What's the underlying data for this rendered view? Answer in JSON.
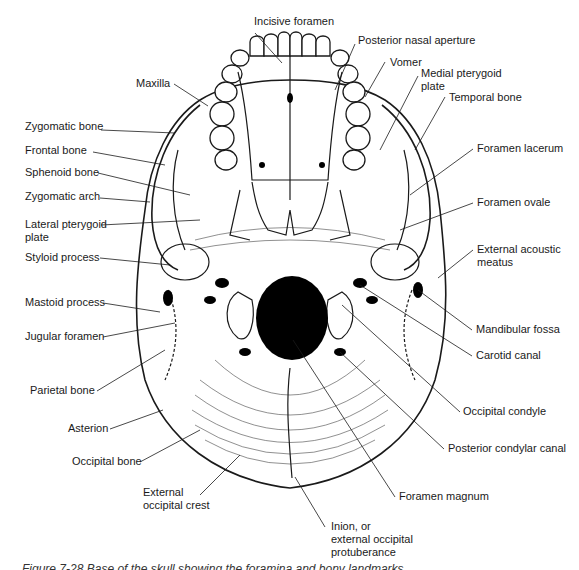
{
  "figure": {
    "caption": "Figure 7-28  Base of the skull showing the foramina and bony landmarks."
  },
  "labels": {
    "incisive_foramen": "Incisive foramen",
    "posterior_nasal_aperture": "Posterior nasal aperture",
    "vomer": "Vomer",
    "medial_pterygoid_plate": "Medial pterygoid\nplate",
    "temporal_bone": "Temporal bone",
    "maxilla": "Maxilla",
    "zygomatic_bone": "Zygomatic bone",
    "frontal_bone": "Frontal bone",
    "sphenoid_bone": "Sphenoid bone",
    "zygomatic_arch": "Zygomatic arch",
    "lateral_pterygoid_plate": "Lateral pterygoid\nplate",
    "styloid_process": "Styloid process",
    "mastoid_process": "Mastoid process",
    "jugular_foramen": "Jugular foramen",
    "parietal_bone": "Parietal bone",
    "asterion": "Asterion",
    "occipital_bone": "Occipital bone",
    "external_occipital_crest": "External\noccipital crest",
    "inion": "Inion, or\nexternal occipital\nprotuberance",
    "foramen_magnum": "Foramen magnum",
    "posterior_condylar_canal": "Posterior condylar canal",
    "occipital_condyle": "Occipital condyle",
    "carotid_canal": "Carotid canal",
    "mandibular_fossa": "Mandibular fossa",
    "external_acoustic_meatus": "External acoustic\nmeatus",
    "foramen_ovale": "Foramen ovale",
    "foramen_lacerum": "Foramen lacerum"
  },
  "colors": {
    "ink": "#1a1a1a",
    "paper": "#ffffff",
    "foramen_fill": "#000000"
  }
}
